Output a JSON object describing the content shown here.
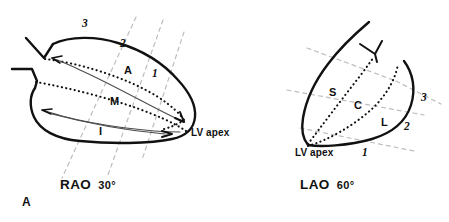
{
  "figure": {
    "panel_letter": "A",
    "ink_color": "#111111",
    "dash_color": "#b9b9b9",
    "background": "#ffffff"
  },
  "panels": [
    {
      "id": "rao",
      "caption": "RAO  30°",
      "caption_text": "RAO",
      "caption_angle": "30°",
      "apex_label": "LV apex",
      "segments": [
        {
          "code": "A",
          "name": "anterior"
        },
        {
          "code": "M",
          "name": "mid"
        },
        {
          "code": "I",
          "name": "inferior"
        }
      ],
      "plane_numbers": [
        "3",
        "2",
        "1"
      ]
    },
    {
      "id": "lao",
      "caption": "LAO  60°",
      "caption_text": "LAO",
      "caption_angle": "60°",
      "apex_label": "LV apex",
      "segments": [
        {
          "code": "S",
          "name": "septal"
        },
        {
          "code": "C",
          "name": "central"
        },
        {
          "code": "L",
          "name": "lateral"
        }
      ],
      "plane_numbers": [
        "3",
        "2",
        "1"
      ]
    }
  ],
  "labels": {
    "rao_seg_A": "A",
    "rao_seg_M": "M",
    "rao_seg_I": "I",
    "rao_num_3": "3",
    "rao_num_2": "2",
    "rao_num_1": "1",
    "rao_apex": "LV apex",
    "rao_caption": "RAO",
    "rao_degrees": "30°",
    "lao_seg_S": "S",
    "lao_seg_C": "C",
    "lao_seg_L": "L",
    "lao_num_3": "3",
    "lao_num_2": "2",
    "lao_num_1": "1",
    "lao_apex": "LV apex",
    "lao_caption": "LAO",
    "lao_degrees": "60°",
    "panel_letter": "A"
  }
}
